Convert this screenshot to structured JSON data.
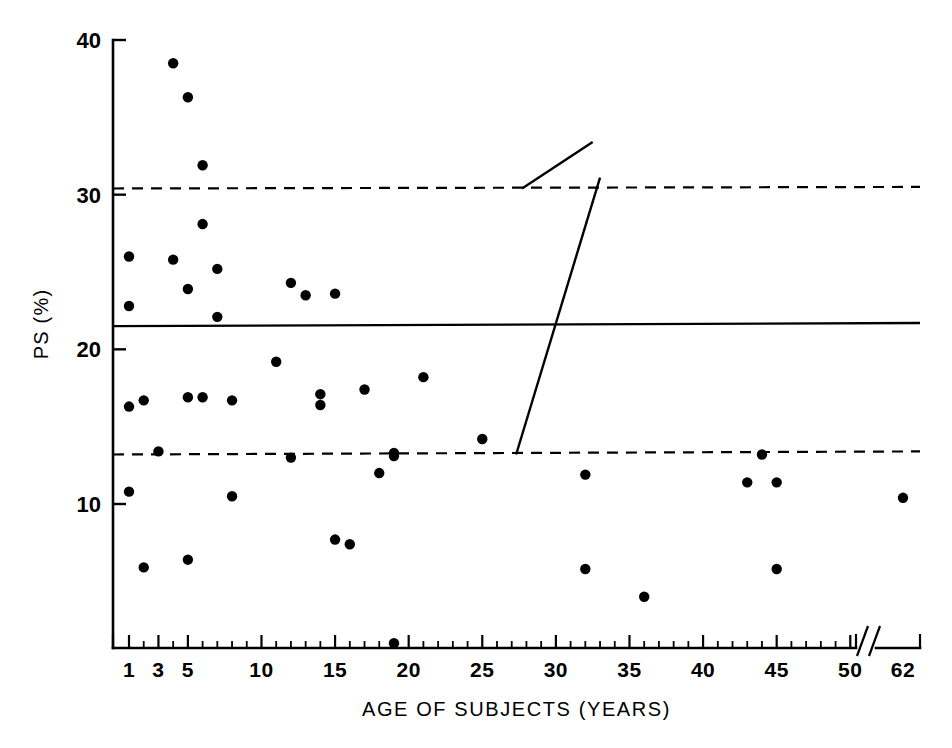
{
  "chart_data": {
    "type": "scatter",
    "title": "",
    "xlabel": "AGE OF SUBJECTS (YEARS)",
    "ylabel": "PS (%)",
    "xlim": [
      0,
      63
    ],
    "ylim": [
      0,
      40
    ],
    "grid": false,
    "legend": "none",
    "x_tick_labels": [
      "1",
      "3",
      "5",
      "10",
      "15",
      "20",
      "25",
      "30",
      "35",
      "40",
      "45",
      "50",
      "62"
    ],
    "x_tick_values": [
      1,
      3,
      5,
      10,
      15,
      20,
      25,
      30,
      35,
      40,
      45,
      50,
      62
    ],
    "x_axis_break": {
      "present": true,
      "symbol": "//",
      "between": [
        50,
        62
      ]
    },
    "x_minor_tick_step": 1,
    "y_tick_labels": [
      "10",
      "20",
      "30",
      "40"
    ],
    "y_tick_values": [
      10,
      20,
      30,
      40
    ],
    "points": [
      {
        "x": 1,
        "y": 26.0
      },
      {
        "x": 1,
        "y": 22.8
      },
      {
        "x": 1,
        "y": 16.3
      },
      {
        "x": 1,
        "y": 10.8
      },
      {
        "x": 2,
        "y": 16.7
      },
      {
        "x": 2,
        "y": 5.9
      },
      {
        "x": 3,
        "y": 13.4
      },
      {
        "x": 4,
        "y": 38.5
      },
      {
        "x": 4,
        "y": 25.8
      },
      {
        "x": 5,
        "y": 36.3
      },
      {
        "x": 5,
        "y": 23.9
      },
      {
        "x": 5,
        "y": 16.9
      },
      {
        "x": 5,
        "y": 6.4
      },
      {
        "x": 6,
        "y": 31.9
      },
      {
        "x": 6,
        "y": 28.1
      },
      {
        "x": 6,
        "y": 16.9
      },
      {
        "x": 7,
        "y": 22.1
      },
      {
        "x": 7,
        "y": 25.2
      },
      {
        "x": 8,
        "y": 16.7
      },
      {
        "x": 8,
        "y": 10.5
      },
      {
        "x": 11,
        "y": 19.2
      },
      {
        "x": 12,
        "y": 24.3
      },
      {
        "x": 12,
        "y": 13.0
      },
      {
        "x": 13,
        "y": 23.5
      },
      {
        "x": 14,
        "y": 17.1
      },
      {
        "x": 14,
        "y": 16.4
      },
      {
        "x": 15,
        "y": 23.6
      },
      {
        "x": 15,
        "y": 7.7
      },
      {
        "x": 16,
        "y": 7.4
      },
      {
        "x": 17,
        "y": 17.4
      },
      {
        "x": 18,
        "y": 12.0
      },
      {
        "x": 19,
        "y": 13.3
      },
      {
        "x": 19,
        "y": 13.1
      },
      {
        "x": 19,
        "y": 1.0
      },
      {
        "x": 21,
        "y": 18.2
      },
      {
        "x": 25,
        "y": 14.2
      },
      {
        "x": 32,
        "y": 11.9
      },
      {
        "x": 32,
        "y": 5.8
      },
      {
        "x": 36,
        "y": 4.0
      },
      {
        "x": 43,
        "y": 11.4
      },
      {
        "x": 44,
        "y": 13.2
      },
      {
        "x": 45,
        "y": 11.4
      },
      {
        "x": 45,
        "y": 5.8
      },
      {
        "x": 62,
        "y": 10.4
      }
    ],
    "reference_lines": [
      {
        "name": "upper-sd-line",
        "style": "dashed",
        "y_left": 30.4,
        "y_right": 30.5
      },
      {
        "name": "mean-line",
        "style": "solid",
        "y_left": 21.5,
        "y_right": 21.7
      },
      {
        "name": "lower-sd-line",
        "style": "dashed",
        "y_left": 13.2,
        "y_right": 13.4
      }
    ],
    "annotation_lines": [
      {
        "name": "annotation-line-upper",
        "x1": 27.7,
        "y1": 30.4,
        "x2": 32.5,
        "y2": 33.4
      },
      {
        "name": "annotation-line-lower",
        "x1": 27.3,
        "y1": 13.2,
        "x2": 33.0,
        "y2": 31.1
      }
    ],
    "colors": {
      "axis": "#000000",
      "point": "#000000",
      "mean_line": "#000000",
      "sd_line": "#000000",
      "background": "#ffffff"
    }
  }
}
